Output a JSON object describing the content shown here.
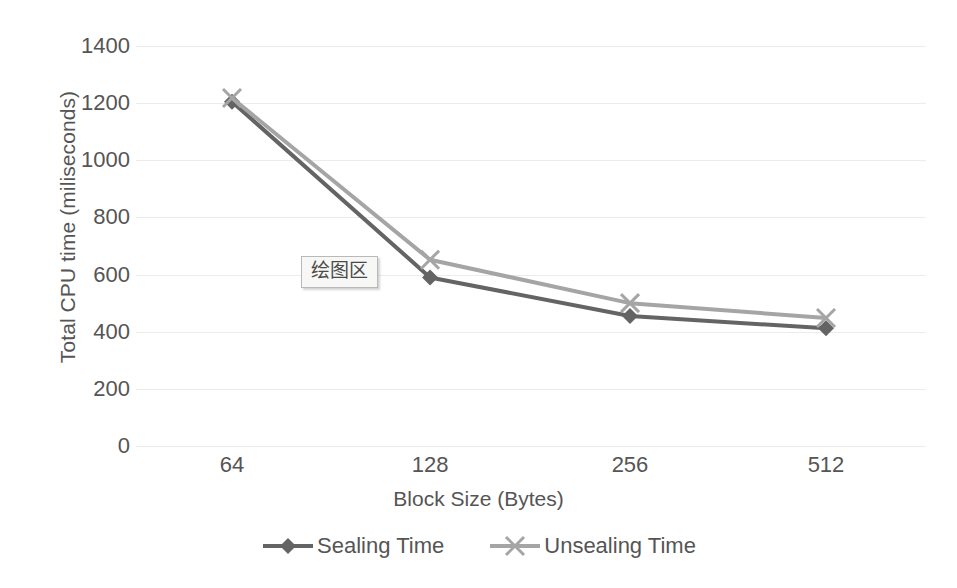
{
  "chart_data": {
    "type": "line",
    "title": "",
    "xlabel": "Block Size (Bytes)",
    "ylabel": "Total CPU time (miliseconds)",
    "categories": [
      "64",
      "128",
      "256",
      "512"
    ],
    "x": [
      64,
      128,
      256,
      512
    ],
    "ylim": [
      0,
      1400
    ],
    "ytick_labels": [
      "1400",
      "1200",
      "1000",
      "800",
      "600",
      "400",
      "200",
      "0"
    ],
    "ytick_values": [
      1400,
      1200,
      1000,
      800,
      600,
      400,
      200,
      0
    ],
    "grid": true,
    "legend_position": "bottom",
    "series": [
      {
        "name": "Sealing Time",
        "color": "#646464",
        "marker": "diamond",
        "values": [
          1205,
          590,
          455,
          412
        ]
      },
      {
        "name": "Unsealing Time",
        "color": "#a5a5a5",
        "marker": "x",
        "values": [
          1218,
          652,
          500,
          448
        ]
      }
    ]
  },
  "axes": {
    "y_title": "Total CPU time (miliseconds)",
    "x_title": "Block Size (Bytes)",
    "y_ticks": [
      "1400",
      "1200",
      "1000",
      "800",
      "600",
      "400",
      "200",
      "0"
    ],
    "x_ticks": [
      "64",
      "128",
      "256",
      "512"
    ]
  },
  "legend": {
    "items": [
      {
        "label": "Sealing Time",
        "color": "#646464",
        "marker": "diamond-marker"
      },
      {
        "label": "Unsealing Time",
        "color": "#a5a5a5",
        "marker": "x-marker"
      }
    ]
  },
  "tooltip": {
    "text": "绘图区"
  },
  "colors": {
    "background": "#ffffff",
    "gridline": "#ececec",
    "text": "#555555",
    "series_sealing": "#646464",
    "series_unsealing": "#a5a5a5",
    "tooltip_background": "#f7f7f5",
    "tooltip_border": "#b9b9b9"
  }
}
